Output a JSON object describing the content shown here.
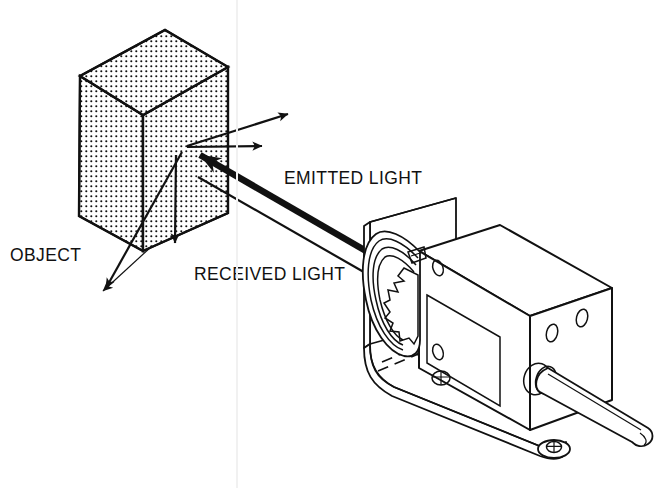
{
  "figure": {
    "background_color": "#ffffff",
    "ink_color": "#111111",
    "width": 664,
    "height": 488
  },
  "labels": {
    "object": "OBJECT",
    "emitted_light": "EMITTED LIGHT",
    "received_light": "RECEIVED LIGHT"
  },
  "icons": {
    "object_block": "stippled-cube-icon",
    "sensor": "photoelectric-sensor-icon",
    "lens": "sensor-lens-icon",
    "bracket": "mounting-bracket-icon",
    "cable": "sensor-cable-icon",
    "emitted_beam": "thick-beam-arrow-icon",
    "received_beam": "thin-beam-arrow-icon",
    "scatter_rays": "scattered-ray-arrows-icon",
    "leader_lines": "leader-line-arrows-icon",
    "screws": "screw-head-icon"
  },
  "geometry": {
    "object_block": {
      "top_apex": [
        165,
        30
      ],
      "left_corner": [
        80,
        76
      ],
      "right_corner": [
        228,
        67
      ],
      "front_corner": [
        143,
        115
      ],
      "bottom_left": [
        79,
        216
      ],
      "bottom_front": [
        143,
        251
      ],
      "bottom_right": [
        228,
        213
      ]
    },
    "reflection_point": [
      186,
      146
    ],
    "sensor_lens_center": [
      398,
      272
    ],
    "emitted_beam": {
      "from": [
        398,
        268
      ],
      "to": [
        189,
        149
      ]
    },
    "received_beam": {
      "from": [
        197,
        175
      ],
      "to": [
        384,
        282
      ]
    },
    "scatter_rays": [
      {
        "from": [
          186,
          146
        ],
        "to": [
          294,
          113
        ]
      },
      {
        "from": [
          186,
          146
        ],
        "to": [
          268,
          145
        ]
      },
      {
        "from": [
          186,
          146
        ],
        "to": [
          175,
          248
        ]
      },
      {
        "from": [
          186,
          146
        ],
        "to": [
          103,
          293
        ]
      }
    ]
  }
}
